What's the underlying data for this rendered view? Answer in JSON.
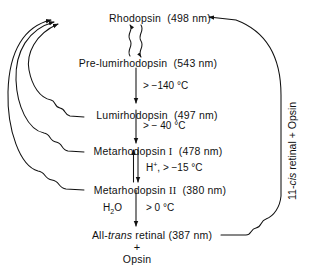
{
  "diagram": {
    "background_color": "#ffffff",
    "line_color": "#111111",
    "nodes": [
      {
        "id": "rhodopsin",
        "name": "Rhodopsin",
        "wavelength": "(498 nm)",
        "label": "Rhodopsin  (498 nm)"
      },
      {
        "id": "prelumi",
        "name": "Pre-lumirhodopsin",
        "wavelength": "(543 nm)",
        "label": "Pre-lumirhodopsin  (543 nm)"
      },
      {
        "id": "lumi",
        "name": "Lumirhodopsin",
        "wavelength": "(497 nm)",
        "label": "Lumirhodopsin  (497 nm)"
      },
      {
        "id": "meta1",
        "name": "Metarhodopsin I",
        "wavelength": "(478 nm)",
        "label": "Metarhodopsin I  (478 nm)"
      },
      {
        "id": "meta2",
        "name": "Metarhodopsin II",
        "wavelength": "(380 nm)",
        "label": "Metarhodopsin II  (380 nm)"
      }
    ],
    "node_labels": {
      "rhodopsin_name": "Rhodopsin",
      "rhodopsin_nm": "(498 nm)",
      "prelumi_name": "Pre-lumirhodopsin",
      "prelumi_nm": "(543 nm)",
      "lumi_name": "Lumirhodopsin",
      "lumi_nm": "(497 nm)",
      "meta1_name": "Metarhodopsin",
      "meta1_numeral": "I",
      "meta1_nm": "(478 nm)",
      "meta2_name": "Metarhodopsin",
      "meta2_numeral": "II",
      "meta2_nm": "(380 nm)",
      "alltrans_prefix": "All-",
      "alltrans_italic": "trans",
      "alltrans_rest": "retinal",
      "alltrans_nm": "(387 nm)",
      "plus_sign": "+",
      "opsin": "Opsin"
    },
    "conditions": {
      "prelumi_to_lumi": "> −140 °C",
      "lumi_to_meta1": "> − 40 °C",
      "meta1_to_meta2_reagent": "H",
      "meta1_to_meta2_reagent_sup": "+",
      "meta1_to_meta2": ",  > −15 °C",
      "meta2_to_alltrans_reagent_a": "H",
      "meta2_to_alltrans_reagent_sub": "2",
      "meta2_to_alltrans_reagent_b": "O",
      "meta2_to_alltrans": "> 0 °C"
    },
    "regeneration_path": {
      "label_prefix": "11-",
      "label_italic": "cis",
      "label_suffix": " retinal + Opsin",
      "label_full": "11-cis retinal + Opsin",
      "orientation": "vertical-rotated-90",
      "from": "All-trans retinal (387 nm)",
      "to": "Rhodopsin"
    },
    "photon_arrows": {
      "description": "wavy arrows denote light (hv) absorption",
      "count": 4,
      "targets": [
        "rhodopsin",
        "prelumi",
        "lumi-to-rhodopsin",
        "meta1-to-rhodopsin",
        "meta2-to-rhodopsin"
      ]
    }
  }
}
